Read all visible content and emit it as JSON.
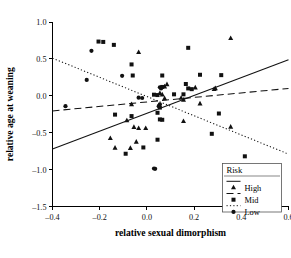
{
  "chart_data": {
    "type": "scatter",
    "title": "",
    "xlabel": "relative sexual dimorphism",
    "ylabel": "relative age at weaning",
    "xlim": [
      -0.4,
      0.6
    ],
    "ylim": [
      -1.5,
      1.0
    ],
    "xticks": [
      "-0.4",
      "-0.2",
      "0.0",
      "0.2",
      "0.4",
      "0.6"
    ],
    "xtick_values": [
      -0.4,
      -0.2,
      0.0,
      0.2,
      0.4,
      0.6
    ],
    "yticks": [
      "1.0",
      "0.5",
      "0.0",
      "-0.5",
      "-1.0",
      "-1.5"
    ],
    "ytick_values": [
      1.0,
      0.5,
      0.0,
      -0.5,
      -1.0,
      -1.5
    ],
    "grid": false,
    "legend": {
      "title": "Risk",
      "position": "bottom-right",
      "entries": [
        {
          "label": "High",
          "marker": "triangle",
          "line": "solid",
          "color": "#111111"
        },
        {
          "label": "Mid",
          "marker": "square",
          "line": "dashed",
          "color": "#111111"
        },
        {
          "label": "Low",
          "marker": "circle",
          "line": "dotted",
          "color": "#111111"
        }
      ]
    },
    "series": [
      {
        "name": "High",
        "marker": "triangle",
        "line": "solid",
        "color": "#111111",
        "fit_line": {
          "x1": -0.4,
          "y1": -0.72,
          "x2": 0.6,
          "y2": 0.49
        },
        "points": [
          [
            0.355,
            0.78
          ],
          [
            -0.035,
            0.59
          ],
          [
            0.085,
            0.155
          ],
          [
            0.075,
            0.125
          ],
          [
            0.29,
            0.1
          ],
          [
            0.205,
            0.11
          ],
          [
            0.285,
            0.09
          ],
          [
            0.055,
            0.035
          ],
          [
            0.065,
            0.015
          ],
          [
            0.075,
            -0.035
          ],
          [
            0.145,
            -0.03
          ],
          [
            0.155,
            -0.055
          ],
          [
            -0.065,
            -0.115
          ],
          [
            0.225,
            -0.105
          ],
          [
            -0.085,
            -0.335
          ],
          [
            0.155,
            -0.345
          ],
          [
            -0.055,
            -0.425
          ],
          [
            -0.035,
            -0.44
          ],
          [
            -0.005,
            -0.44
          ],
          [
            0.355,
            -0.42
          ],
          [
            -0.155,
            -0.575
          ],
          [
            -0.045,
            -0.625
          ],
          [
            -0.135,
            -0.705
          ],
          [
            -0.07,
            -0.71
          ]
        ]
      },
      {
        "name": "Mid",
        "marker": "square",
        "line": "dashed",
        "color": "#111111",
        "fit_line": {
          "x1": -0.4,
          "y1": -0.205,
          "x2": 0.6,
          "y2": 0.1
        },
        "points": [
          [
            -0.205,
            0.735
          ],
          [
            -0.185,
            0.73
          ],
          [
            -0.14,
            0.69
          ],
          [
            0.175,
            0.65
          ],
          [
            -0.065,
            0.425
          ],
          [
            0.315,
            0.28
          ],
          [
            0.065,
            0.275
          ],
          [
            -0.06,
            0.275
          ],
          [
            0.225,
            0.285
          ],
          [
            0.165,
            0.16
          ],
          [
            0.175,
            0.1
          ],
          [
            0.19,
            0.09
          ],
          [
            0.065,
            0.12
          ],
          [
            0.155,
            0.02
          ],
          [
            0.115,
            0.02
          ],
          [
            0.045,
            0.01
          ],
          [
            0.03,
            0.015
          ],
          [
            0.055,
            -0.16
          ],
          [
            -0.135,
            -0.255
          ],
          [
            -0.065,
            -0.275
          ],
          [
            0.045,
            -0.23
          ],
          [
            0.305,
            -0.24
          ],
          [
            0.055,
            -0.32
          ],
          [
            0.065,
            -0.325
          ],
          [
            0.045,
            -0.595
          ],
          [
            0.275,
            -0.515
          ],
          [
            -0.015,
            -0.7
          ],
          [
            -0.09,
            -0.785
          ],
          [
            0.415,
            -0.82
          ]
        ]
      },
      {
        "name": "Low",
        "marker": "circle",
        "line": "dotted",
        "color": "#111111",
        "fit_line": {
          "x1": -0.4,
          "y1": 0.51,
          "x2": 0.6,
          "y2": -0.79
        },
        "points": [
          [
            -0.235,
            0.61
          ],
          [
            -0.255,
            0.215
          ],
          [
            -0.105,
            0.27
          ],
          [
            0.055,
            0.115
          ],
          [
            0.06,
            0.1
          ],
          [
            -0.035,
            -0.025
          ],
          [
            -0.02,
            -0.03
          ],
          [
            0.055,
            -0.115
          ],
          [
            0.05,
            -0.14
          ],
          [
            -0.345,
            -0.14
          ],
          [
            0.03,
            -0.985
          ],
          [
            0.035,
            -0.99
          ]
        ]
      }
    ]
  }
}
